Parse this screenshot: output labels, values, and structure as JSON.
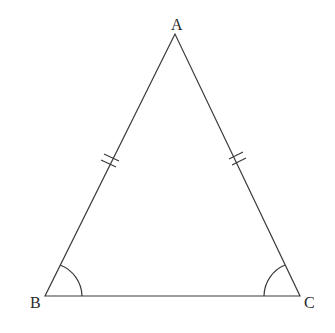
{
  "diagram": {
    "vertices": {
      "A": {
        "label": "A",
        "x": 175,
        "y": 34
      },
      "B": {
        "label": "B",
        "x": 45,
        "y": 296
      },
      "C": {
        "label": "C",
        "x": 300,
        "y": 296
      }
    },
    "equal_sides": [
      "AB",
      "AC"
    ],
    "tick_marks_per_side": 2,
    "equal_angles": [
      "B",
      "C"
    ],
    "colors": {
      "stroke": "#3a3a3a",
      "background": "#ffffff"
    }
  }
}
